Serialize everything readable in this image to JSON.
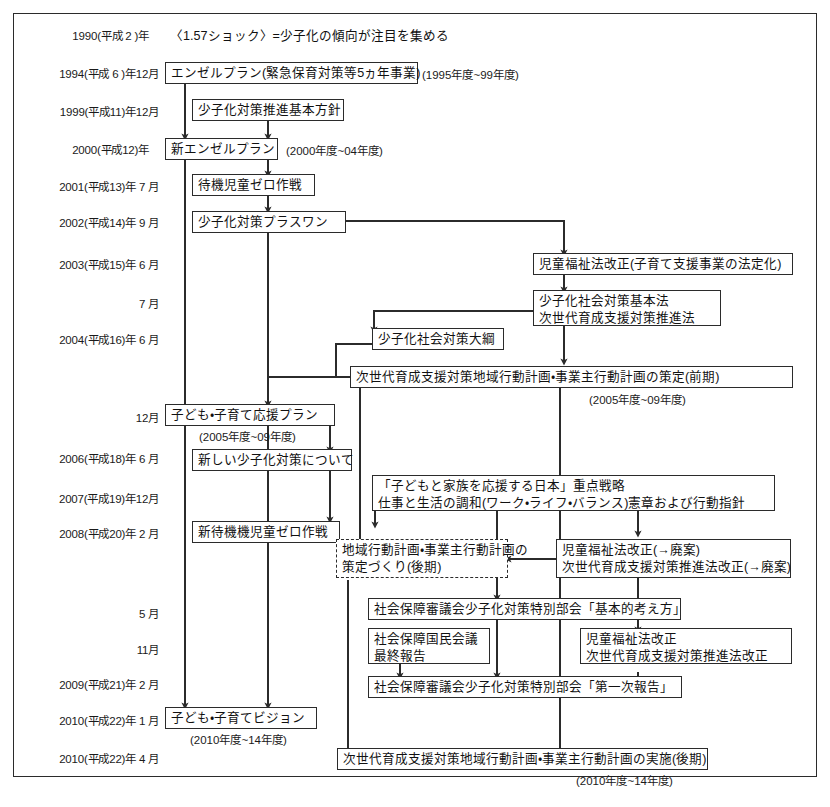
{
  "document": {
    "title": "少子化対策の経緯",
    "frame": {
      "border_color": "#2b2b2b",
      "background": "#ffffff"
    }
  },
  "dates": [
    {
      "id": "d1990",
      "label": "1990(平成 2 )年"
    },
    {
      "id": "d1994",
      "label": "1994(平成 6 )年12月"
    },
    {
      "id": "d1999",
      "label": "1999(平成11)年12月"
    },
    {
      "id": "d2000",
      "label": "2000(平成12)年"
    },
    {
      "id": "d2001",
      "label": "2001(平成13)年 7 月"
    },
    {
      "id": "d2002",
      "label": "2002(平成14)年 9 月"
    },
    {
      "id": "d2003",
      "label": "2003(平成15)年 6 月"
    },
    {
      "id": "d2003b",
      "label": "7 月"
    },
    {
      "id": "d2004",
      "label": "2004(平成16)年 6 月"
    },
    {
      "id": "d2004b",
      "label": "12月"
    },
    {
      "id": "d2006",
      "label": "2006(平成18)年 6 月"
    },
    {
      "id": "d2007",
      "label": "2007(平成19)年12月"
    },
    {
      "id": "d2008",
      "label": "2008(平成20)年 2 月"
    },
    {
      "id": "d2008b",
      "label": "5 月"
    },
    {
      "id": "d2008c",
      "label": "11月"
    },
    {
      "id": "d2009",
      "label": "2009(平成21)年 2 月"
    },
    {
      "id": "d2010",
      "label": "2010(平成22)年 1 月"
    },
    {
      "id": "d2010b",
      "label": "2010(平成22)年 4 月"
    }
  ],
  "events": {
    "shock_1990": "〈1.57ショック〉=少子化の傾向が注目を集める",
    "angel_plan": "エンゼルプラン(緊急保育対策等5ヵ年事業)",
    "angel_plan_period": "(1995年度~99年度)",
    "basic_policy_1999": "少子化対策推進基本方針",
    "new_angel_plan": "新エンゼルプラン",
    "new_angel_plan_period": "(2000年度~04年度)",
    "zero_waiting_2001": "待機児童ゼロ作戦",
    "plus_one_2002": "少子化対策プラスワン",
    "child_welfare_law_2003": "児童福祉法改正(子育て支援事業の法定化)",
    "basic_law_2003_line1": "少子化社会対策基本法",
    "basic_law_2003_line2": "次世代育成支援対策推進法",
    "outline_2004": "少子化社会対策大綱",
    "local_plan_early": "次世代育成支援対策地域行動計画・事業主行動計画の策定(前期)",
    "local_plan_early_period": "(2005年度~09年度)",
    "support_plan_2004": "子ども・子育て応援プラン",
    "support_plan_2004_period": "(2005年度~09年度)",
    "new_measures_2006": "新しい少子化対策について",
    "strategy_2007_line1": "「子どもと家族を応援する日本」重点戦略",
    "strategy_2007_line2": "仕事と生活の調和(ワーク・ライフ・バランス)憲章および行動指針",
    "new_zero_waiting_2008": "新待機機児童ゼロ作戦",
    "local_plan_late_line1": "地域行動計画・事業主行動計画の",
    "local_plan_late_line2": "策定づくり(後期)",
    "law_revision_abolished_line1": "児童福祉法改正(→廃案)",
    "law_revision_abolished_line2": "次世代育成支援対策推進法改正(→廃案)",
    "council_basic_2008": "社会保障審議会少子化対策特別部会「基本的考え方」",
    "national_council_line1": "社会保障国民会議",
    "national_council_line2": "最終報告",
    "law_revision_2008_line1": "児童福祉法改正",
    "law_revision_2008_line2": "次世代育成支援対策推進法改正",
    "council_first_report_2009": "社会保障審議会少子化対策特別部会「第一次報告」",
    "vision_2010": "子ども・子育てビジョン",
    "vision_2010_period": "(2010年度~14年度)",
    "local_plan_impl_late": "次世代育成支援対策地域行動計画・事業主行動計画の実施(後期)",
    "local_plan_impl_late_period": "(2010年度~14年度)"
  }
}
